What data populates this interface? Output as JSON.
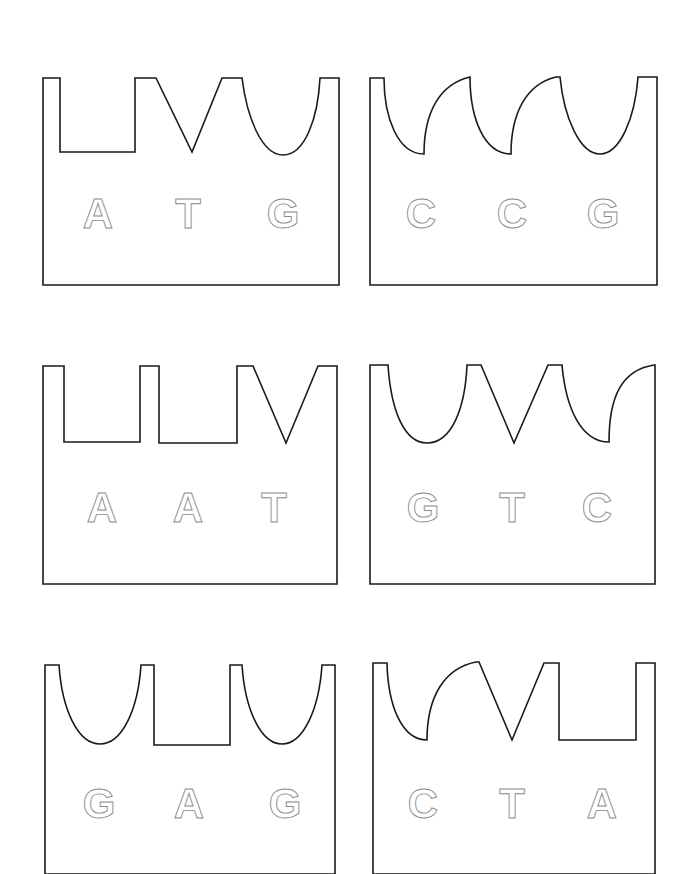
{
  "diagram": {
    "title": "",
    "cards": [
      {
        "id": "card-1",
        "sequence": "ATG",
        "letters": [
          {
            "char": "A",
            "x": 98,
            "y": 228
          },
          {
            "char": "T",
            "x": 188,
            "y": 228
          },
          {
            "char": "G",
            "x": 283,
            "y": 228
          }
        ],
        "path": "M43,78 L60,78 L60,152 L135,152 L135,78 L156,78 L192,152 L222,78 L242,78 C247,118 262,155 283,155 C305,155 318,118 320,78 L339,78 L339,285 L43,285 Z"
      },
      {
        "id": "card-2",
        "sequence": "CCG",
        "letters": [
          {
            "char": "C",
            "x": 421,
            "y": 228
          },
          {
            "char": "C",
            "x": 512,
            "y": 228
          },
          {
            "char": "G",
            "x": 603,
            "y": 228
          }
        ],
        "path": "M370,78 L384,78 C384,118 398,154 424,154 C424,112 440,84 470,77 C470,118 484,154 511,154 C511,112 527,84 556,77 L560,77 C564,118 580,154 600,154 C620,154 635,118 638,77 L657,77 L657,285 L370,285 Z"
      },
      {
        "id": "card-3",
        "sequence": "AAT",
        "letters": [
          {
            "char": "A",
            "x": 102,
            "y": 522
          },
          {
            "char": "A",
            "x": 188,
            "y": 522
          },
          {
            "char": "T",
            "x": 274,
            "y": 522
          }
        ],
        "path": "M43,366 L64,366 L64,442 L140,442 L140,366 L159,366 L159,443 L237,443 L237,366 L253,366 L286,443 L318,366 L337,366 L337,584 L43,584 Z"
      },
      {
        "id": "card-4",
        "sequence": "GTC",
        "letters": [
          {
            "char": "G",
            "x": 423,
            "y": 522
          },
          {
            "char": "T",
            "x": 512,
            "y": 522
          },
          {
            "char": "C",
            "x": 597,
            "y": 522
          }
        ],
        "path": "M370,365 L388,365 C391,410 404,443 427,443 C451,443 465,410 467,365 L481,365 L514,443 L548,365 L562,365 C566,410 582,442 609,442 C609,396 622,370 654,365 L655,365 L655,584 L370,584 Z"
      },
      {
        "id": "card-5",
        "sequence": "GAG",
        "letters": [
          {
            "char": "G",
            "x": 99,
            "y": 818
          },
          {
            "char": "A",
            "x": 189,
            "y": 818
          },
          {
            "char": "G",
            "x": 285,
            "y": 818
          }
        ],
        "path": "M45,665 L59,665 C62,710 78,744 100,744 C122,744 138,710 141,665 L154,665 L154,745 L230,745 L230,665 L242,665 C245,710 261,744 282,744 C303,744 319,710 322,665 L335,665 L335,874 L45,874 Z"
      },
      {
        "id": "card-6",
        "sequence": "CTA",
        "letters": [
          {
            "char": "C",
            "x": 423,
            "y": 818
          },
          {
            "char": "T",
            "x": 512,
            "y": 818
          },
          {
            "char": "A",
            "x": 602,
            "y": 818
          }
        ],
        "path": "M373,663 L387,663 C388,706 402,740 427,740 C427,696 445,668 476,662 L479,662 L512,740 L544,663 L559,663 L559,740 L636,740 L636,663 L655,663 L655,874 L373,874 Z"
      }
    ],
    "colors": {
      "outline": "#1a1a1a",
      "letter_stroke": "#8a8a8a",
      "background": "#ffffff"
    }
  }
}
